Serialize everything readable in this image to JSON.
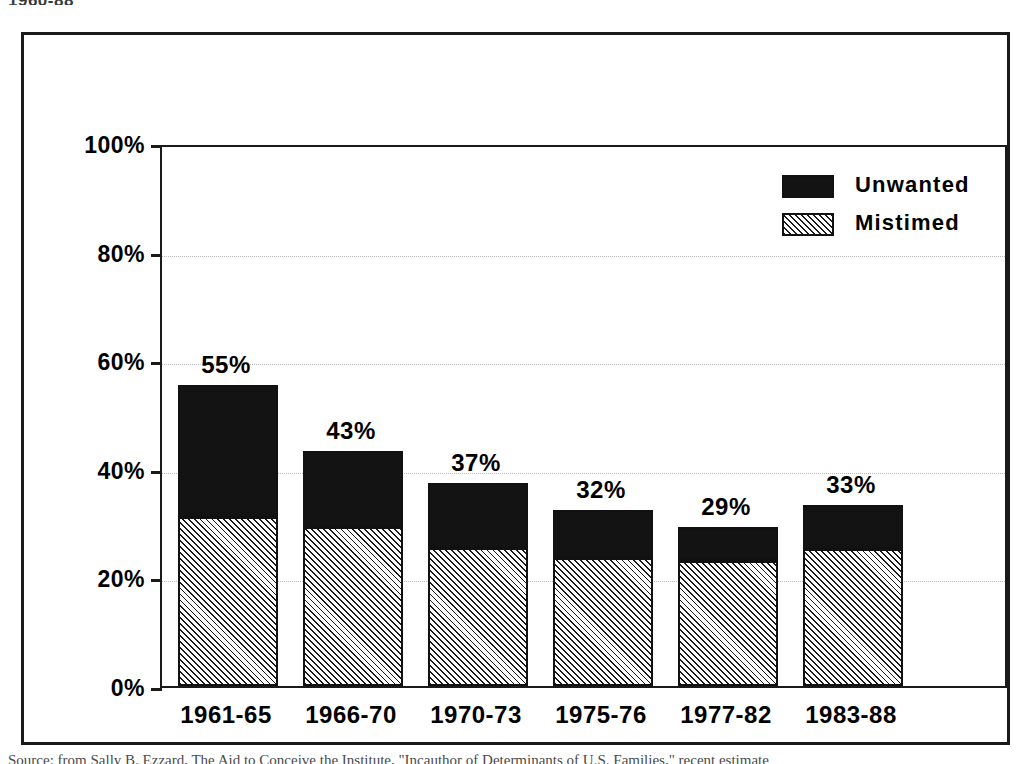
{
  "figure": {
    "top_heading": "1960-88",
    "caption": "Source: from Sally B. Ezzard, The Aid to Conceive the Institute, \"Incauthor of Determinants of U.S. Families,\" recent estimate"
  },
  "legend": {
    "position": "top-right",
    "items": [
      {
        "label": "Unwanted",
        "swatch": "solid-black",
        "color": "#131313"
      },
      {
        "label": "Mistimed",
        "swatch": "diagonal-hatch",
        "color": "#1a1a1a"
      }
    ]
  },
  "chart_data": {
    "type": "bar",
    "subtype": "stacked",
    "title": "",
    "xlabel": "",
    "ylabel": "",
    "ylim": [
      0,
      100
    ],
    "ytick_values": [
      0,
      20,
      40,
      60,
      80,
      100
    ],
    "ytick_labels": [
      "0%",
      "20%",
      "40%",
      "60%",
      "80%",
      "100%"
    ],
    "grid": true,
    "categories": [
      "1961-65",
      "1966-70",
      "1970-73",
      "1975-76",
      "1977-82",
      "1983-88"
    ],
    "series": [
      {
        "name": "Mistimed",
        "values": [
          31.2,
          29.3,
          25.5,
          23.5,
          23.0,
          25.3
        ]
      },
      {
        "name": "Unwanted",
        "values": [
          23.8,
          13.7,
          11.5,
          8.5,
          6.0,
          7.7
        ]
      }
    ],
    "totals": [
      55,
      43,
      37,
      32,
      29,
      33
    ],
    "data_labels": [
      "55%",
      "43%",
      "37%",
      "32%",
      "29%",
      "33%"
    ]
  }
}
